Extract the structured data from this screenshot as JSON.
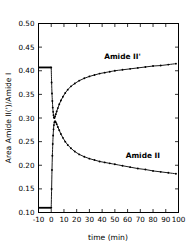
{
  "chart_data": {
    "type": "line",
    "title": "",
    "xlabel": "time (min)",
    "ylabel": "Area Amide II(')/Amide I",
    "xlim": [
      -10,
      100
    ],
    "ylim": [
      0.1,
      0.5
    ],
    "xticks": [
      -10,
      0,
      10,
      20,
      30,
      40,
      50,
      60,
      70,
      80,
      90,
      100
    ],
    "xtick_labels": [
      "-10",
      "0",
      "10",
      "20",
      "30",
      "40",
      "50",
      "60",
      "70",
      "80",
      "90",
      "100"
    ],
    "yticks": [
      0.1,
      0.15,
      0.2,
      0.25,
      0.3,
      0.35,
      0.4,
      0.45,
      0.5
    ],
    "ytick_labels": [
      "0.10",
      "0.15",
      "0.20",
      "0.25",
      "0.30",
      "0.35",
      "0.40",
      "0.45",
      "0.50"
    ],
    "grid": false,
    "legend": "inline-annotations",
    "annotations": [
      {
        "text": "Amide II'",
        "x": 56,
        "y": 0.425
      },
      {
        "text": "Amide II",
        "x": 72,
        "y": 0.215
      }
    ],
    "series": [
      {
        "name": "Amide II'",
        "color": "#000000",
        "marker": "dot",
        "baseline_value": 0.407,
        "baseline_x": [
          -10.5,
          0
        ],
        "points": [
          {
            "x": 0.0,
            "y": 0.407
          },
          {
            "x": 0.3,
            "y": 0.375
          },
          {
            "x": 0.6,
            "y": 0.352
          },
          {
            "x": 0.9,
            "y": 0.336
          },
          {
            "x": 1.2,
            "y": 0.322
          },
          {
            "x": 1.5,
            "y": 0.313
          },
          {
            "x": 1.8,
            "y": 0.306
          },
          {
            "x": 2.1,
            "y": 0.301
          },
          {
            "x": 2.5,
            "y": 0.3
          },
          {
            "x": 3.0,
            "y": 0.303
          },
          {
            "x": 3.6,
            "y": 0.308
          },
          {
            "x": 4.3,
            "y": 0.314
          },
          {
            "x": 5.2,
            "y": 0.321
          },
          {
            "x": 6.3,
            "y": 0.329
          },
          {
            "x": 7.6,
            "y": 0.337
          },
          {
            "x": 9.2,
            "y": 0.345
          },
          {
            "x": 11.0,
            "y": 0.353
          },
          {
            "x": 13.0,
            "y": 0.36
          },
          {
            "x": 15.5,
            "y": 0.367
          },
          {
            "x": 18.5,
            "y": 0.373
          },
          {
            "x": 22.0,
            "y": 0.379
          },
          {
            "x": 26.0,
            "y": 0.384
          },
          {
            "x": 30.0,
            "y": 0.388
          },
          {
            "x": 34.0,
            "y": 0.391
          },
          {
            "x": 38.0,
            "y": 0.394
          },
          {
            "x": 42.0,
            "y": 0.396
          },
          {
            "x": 46.0,
            "y": 0.398
          },
          {
            "x": 50.0,
            "y": 0.4
          },
          {
            "x": 56.0,
            "y": 0.402
          },
          {
            "x": 62.0,
            "y": 0.404
          },
          {
            "x": 68.0,
            "y": 0.406
          },
          {
            "x": 74.0,
            "y": 0.408
          },
          {
            "x": 80.0,
            "y": 0.41
          },
          {
            "x": 86.0,
            "y": 0.411
          },
          {
            "x": 92.0,
            "y": 0.413
          },
          {
            "x": 98.0,
            "y": 0.415
          }
        ]
      },
      {
        "name": "Amide II",
        "color": "#000000",
        "marker": "dot",
        "baseline_value": 0.11,
        "baseline_x": [
          -10.5,
          0
        ],
        "points": [
          {
            "x": 0.0,
            "y": 0.11
          },
          {
            "x": 0.3,
            "y": 0.15
          },
          {
            "x": 0.6,
            "y": 0.19
          },
          {
            "x": 0.9,
            "y": 0.22
          },
          {
            "x": 1.2,
            "y": 0.245
          },
          {
            "x": 1.5,
            "y": 0.263
          },
          {
            "x": 1.8,
            "y": 0.276
          },
          {
            "x": 2.1,
            "y": 0.285
          },
          {
            "x": 2.5,
            "y": 0.291
          },
          {
            "x": 3.0,
            "y": 0.293
          },
          {
            "x": 3.6,
            "y": 0.291
          },
          {
            "x": 4.3,
            "y": 0.287
          },
          {
            "x": 5.2,
            "y": 0.281
          },
          {
            "x": 6.3,
            "y": 0.274
          },
          {
            "x": 7.6,
            "y": 0.266
          },
          {
            "x": 9.2,
            "y": 0.258
          },
          {
            "x": 11.0,
            "y": 0.25
          },
          {
            "x": 13.0,
            "y": 0.243
          },
          {
            "x": 15.5,
            "y": 0.236
          },
          {
            "x": 18.5,
            "y": 0.229
          },
          {
            "x": 22.0,
            "y": 0.223
          },
          {
            "x": 26.0,
            "y": 0.218
          },
          {
            "x": 30.0,
            "y": 0.214
          },
          {
            "x": 34.0,
            "y": 0.211
          },
          {
            "x": 38.0,
            "y": 0.208
          },
          {
            "x": 42.0,
            "y": 0.206
          },
          {
            "x": 46.0,
            "y": 0.204
          },
          {
            "x": 50.0,
            "y": 0.202
          },
          {
            "x": 56.0,
            "y": 0.199
          },
          {
            "x": 62.0,
            "y": 0.196
          },
          {
            "x": 68.0,
            "y": 0.193
          },
          {
            "x": 74.0,
            "y": 0.191
          },
          {
            "x": 80.0,
            "y": 0.188
          },
          {
            "x": 86.0,
            "y": 0.186
          },
          {
            "x": 92.0,
            "y": 0.184
          },
          {
            "x": 98.0,
            "y": 0.182
          }
        ]
      }
    ]
  }
}
